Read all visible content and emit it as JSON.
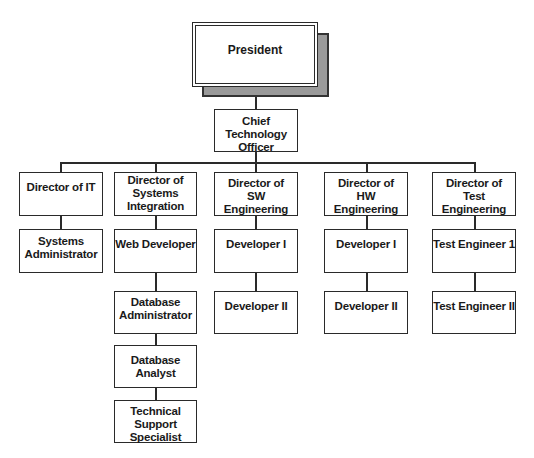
{
  "chart": {
    "type": "org-chart",
    "root": {
      "label": "President",
      "child": {
        "label": "Chief Technology Officer",
        "lines": [
          "Chief Technology",
          "Officer"
        ]
      }
    },
    "directors": [
      {
        "label": "Director of IT",
        "reports": [
          "Systems Administrator"
        ]
      },
      {
        "label": "Director of Systems Integration",
        "reports": [
          "Web Developer",
          "Database Administrator",
          "Database Analyst",
          "Technical Support Specialist"
        ]
      },
      {
        "label": "Director of SW Engineering",
        "reports": [
          "Developer I",
          "Developer II"
        ]
      },
      {
        "label": "Director of HW Engineering",
        "reports": [
          "Developer I",
          "Developer II"
        ]
      },
      {
        "label": "Director of Test Engineering",
        "reports": [
          "Test Engineer 1",
          "Test Engineer II"
        ]
      }
    ]
  },
  "colors": {
    "line": "#2a2a2a",
    "shadow": "#9a9a9a",
    "box": "#ffffff"
  }
}
